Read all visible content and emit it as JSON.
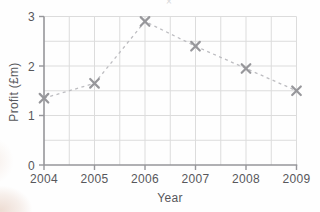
{
  "chart_data": {
    "type": "line",
    "title": "",
    "x": [
      2004,
      2005,
      2006,
      2007,
      2008,
      2009
    ],
    "series": [
      {
        "name": "Profit",
        "values": [
          1.35,
          1.65,
          2.9,
          2.4,
          1.95,
          1.5
        ]
      }
    ],
    "xlabel": "Year",
    "ylabel": "Profit (£m)",
    "xlim": [
      2004,
      2009
    ],
    "ylim": [
      0,
      3
    ],
    "x_tick_labels": [
      "2004",
      "2005",
      "2006",
      "2007",
      "2008",
      "2009"
    ],
    "y_tick_labels": [
      "0",
      "1",
      "2",
      "3"
    ],
    "x_grid_step": 0.5,
    "y_grid_step": 0.5,
    "grid": "on",
    "legend": "none",
    "line_style": "dashed",
    "marker": "x",
    "colors": {
      "grid": "#dcdcdc",
      "axis": "#96969a",
      "line": "#bdbdc1",
      "marker": "#97979b",
      "text": "#57575b"
    }
  },
  "artifacts": {
    "cropped_title_fragment": "×"
  }
}
